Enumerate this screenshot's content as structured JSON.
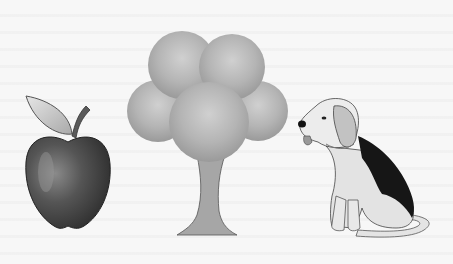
{
  "scene": {
    "description": "Scanned illustration showing three objects side by side",
    "background_color": "#f6f6f6",
    "objects": [
      {
        "name": "apple",
        "icon": "apple-icon",
        "body_color": "#4a4a4a",
        "leaf_color": "#c8c8c8"
      },
      {
        "name": "tree",
        "icon": "tree-icon",
        "canopy_color": "#b5b5b5",
        "trunk_color": "#a8a8a8"
      },
      {
        "name": "dog",
        "icon": "beagle-dog-icon",
        "coat_color": "#dcdcdc",
        "saddle_color": "#1a1a1a",
        "ear_color": "#c4c4c4"
      }
    ]
  }
}
